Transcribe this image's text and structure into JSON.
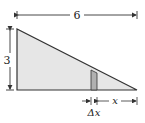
{
  "diagram": {
    "type": "right-triangle-slice",
    "labels": {
      "width": "6",
      "height": "3",
      "x": "x",
      "delta_x": "Δx"
    },
    "colors": {
      "triangle_fill": "#e6e6e6",
      "strip_fill": "#b0b0b0",
      "stroke": "#333333"
    }
  }
}
